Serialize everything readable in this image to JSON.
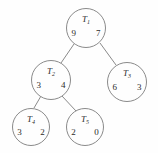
{
  "figure": {
    "type": "binary-tree-diagram",
    "stroke_color": "#8a8a8a",
    "text_color": "#2b2b2b",
    "background_color": "#fefefe"
  },
  "tree": {
    "nodes": [
      {
        "id": "n1",
        "label_base": "T",
        "label_sub": "1",
        "left_value": "9",
        "right_value": "7",
        "cx": 86,
        "cy": 28,
        "r": 20
      },
      {
        "id": "n2",
        "label_base": "T",
        "label_sub": "2",
        "left_value": "3",
        "right_value": "4",
        "cx": 51,
        "cy": 80,
        "r": 20
      },
      {
        "id": "n3",
        "label_base": "T",
        "label_sub": "3",
        "left_value": "6",
        "right_value": "3",
        "cx": 127,
        "cy": 82,
        "r": 20
      },
      {
        "id": "n4",
        "label_base": "T",
        "label_sub": "4",
        "left_value": "3",
        "right_value": "2",
        "cx": 31,
        "cy": 127,
        "r": 19
      },
      {
        "id": "n5",
        "label_base": "T",
        "label_sub": "5",
        "left_value": "2",
        "right_value": "0",
        "cx": 85,
        "cy": 127,
        "r": 19
      }
    ],
    "edges": [
      {
        "id": "e1",
        "from": "n1",
        "to": "n2",
        "x1": 74,
        "y1": 44,
        "x2": 61,
        "y2": 63
      },
      {
        "id": "e2",
        "from": "n1",
        "to": "n3",
        "x1": 100,
        "y1": 43,
        "x2": 116,
        "y2": 65
      },
      {
        "id": "e3",
        "from": "n2",
        "to": "n4",
        "x1": 41,
        "y1": 96,
        "x2": 34,
        "y2": 108
      },
      {
        "id": "e4",
        "from": "n2",
        "to": "n5",
        "x1": 62,
        "y1": 96,
        "x2": 76,
        "y2": 111
      }
    ]
  }
}
